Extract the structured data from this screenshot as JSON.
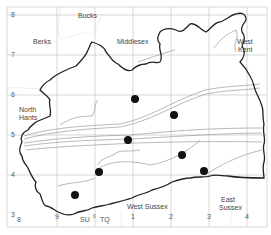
{
  "map": {
    "type": "grid-referenced distribution map",
    "grid": {
      "columns": [
        {
          "label": "8",
          "x": 19
        },
        {
          "label": "9",
          "x": 57
        },
        {
          "label": "0",
          "x": 95
        },
        {
          "label": "1",
          "x": 133
        },
        {
          "label": "2",
          "x": 171
        },
        {
          "label": "3",
          "x": 209
        },
        {
          "label": "4",
          "x": 247
        }
      ],
      "rows": [
        {
          "label": "8",
          "y": 15
        },
        {
          "label": "7",
          "y": 55
        },
        {
          "label": "6",
          "y": 95
        },
        {
          "label": "5",
          "y": 135
        },
        {
          "label": "4",
          "y": 175
        },
        {
          "label": "3",
          "y": 215
        }
      ],
      "square_left": "SU",
      "square_right": "TQ"
    },
    "regions": {
      "bucks": "Bucks",
      "berks": "Berks",
      "middlesex": "Middlesex",
      "west_kent_1": "West",
      "west_kent_2": "Kent",
      "north_hants_1": "North",
      "north_hants_2": "Hants",
      "west_sussex": "West Sussex",
      "east_sussex_1": "East",
      "east_sussex_2": "Sussex"
    },
    "records": [
      {
        "x": 135,
        "y": 99
      },
      {
        "x": 174,
        "y": 115
      },
      {
        "x": 128,
        "y": 140
      },
      {
        "x": 182,
        "y": 155
      },
      {
        "x": 99,
        "y": 172
      },
      {
        "x": 204,
        "y": 171
      },
      {
        "x": 75,
        "y": 195
      }
    ],
    "colors": {
      "boundary": "#222222",
      "grid": "#bbbbbb",
      "contour": "#999999",
      "dot": "#111111",
      "frame": "#cccccc"
    }
  }
}
